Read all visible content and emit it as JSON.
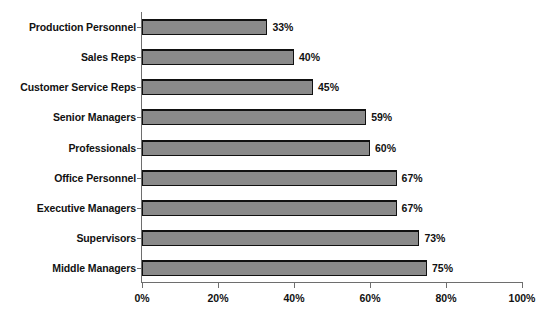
{
  "chart_data": {
    "type": "bar",
    "orientation": "horizontal",
    "title": "",
    "xlabel": "",
    "ylabel": "",
    "categories": [
      "Production Personnel",
      "Sales Reps",
      "Customer Service Reps",
      "Senior Managers",
      "Professionals",
      "Office Personnel",
      "Executive Managers",
      "Supervisors",
      "Middle Managers"
    ],
    "values": [
      33,
      40,
      45,
      59,
      60,
      67,
      67,
      73,
      75
    ],
    "value_labels": [
      "33%",
      "40%",
      "45%",
      "59%",
      "60%",
      "67%",
      "67%",
      "73%",
      "75%"
    ],
    "xlim": [
      0,
      100
    ],
    "xticks": [
      0,
      20,
      40,
      60,
      80,
      100
    ],
    "xtick_labels": [
      "0%",
      "20%",
      "40%",
      "60%",
      "80%",
      "100%"
    ],
    "grid": false,
    "legend": false,
    "bar_color": "#8a8a8a",
    "bar_edge_color": "#111111",
    "axis_color": "#6e6e6e",
    "background_color": "#ffffff"
  }
}
